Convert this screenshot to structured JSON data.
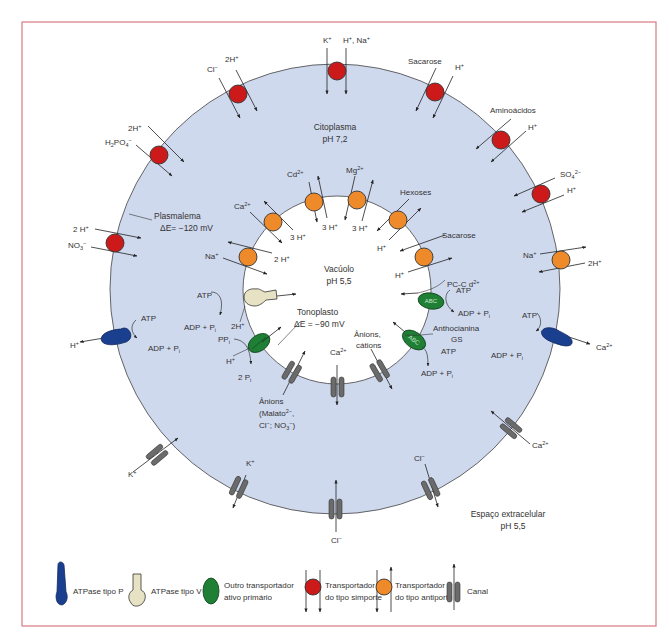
{
  "compartments": {
    "cytoplasm": {
      "label": "Citoplasma",
      "ph": "pH 7,2"
    },
    "vacuole": {
      "label": "Vacúolo",
      "ph": "pH 5,5"
    },
    "extracellular": {
      "label": "Espaço extracelular",
      "ph": "pH 5,5"
    },
    "plasmalemma": {
      "label": "Plasmalema",
      "potential": "ΔE= −120 mV"
    },
    "tonoplast": {
      "label": "Tonoplasto",
      "potential": "ΔE = −90 mV"
    }
  },
  "plasma_membrane_transporters": [
    {
      "type": "simporte",
      "substrates": [
        "K⁺",
        "H⁺, Na⁺"
      ]
    },
    {
      "type": "simporte",
      "substrates": [
        "Cl⁻",
        "2H⁺"
      ]
    },
    {
      "type": "simporte",
      "substrates": [
        "Sacarose",
        "H⁺"
      ]
    },
    {
      "type": "simporte",
      "substrates": [
        "Aminoácidos",
        "H⁺"
      ]
    },
    {
      "type": "simporte",
      "substrates": [
        "2H⁺",
        "H₂PO₄⁻"
      ]
    },
    {
      "type": "simporte",
      "substrates": [
        "SO₄²⁻",
        "H⁺"
      ]
    },
    {
      "type": "simporte",
      "substrates": [
        "2 H⁺",
        "NO₃⁻"
      ]
    },
    {
      "type": "antiporte",
      "substrates": [
        "Na⁺",
        "2H⁺"
      ]
    },
    {
      "type": "ATPase tipo P",
      "substrates": [
        "H⁺"
      ],
      "energy": [
        "ATP",
        "ADP + Pᵢ"
      ]
    },
    {
      "type": "ATPase tipo P",
      "substrates": [
        "Ca²⁺"
      ],
      "energy": [
        "ATP",
        "ADP + Pᵢ"
      ]
    },
    {
      "type": "canal",
      "substrates": [
        "K⁺"
      ]
    },
    {
      "type": "canal",
      "substrates": [
        "K⁺"
      ]
    },
    {
      "type": "canal",
      "substrates": [
        "Cl⁻"
      ]
    },
    {
      "type": "canal",
      "substrates": [
        "Cl⁻"
      ]
    },
    {
      "type": "canal",
      "substrates": [
        "Ca²⁺"
      ]
    }
  ],
  "tonoplast_transporters": [
    {
      "type": "antiporte",
      "substrates": [
        "Ca²⁺",
        "3 H⁺"
      ]
    },
    {
      "type": "antiporte",
      "substrates": [
        "Cd²⁺",
        "3 H⁺"
      ]
    },
    {
      "type": "antiporte",
      "substrates": [
        "Mg²⁺",
        "3 H⁺"
      ]
    },
    {
      "type": "antiporte",
      "substrates": [
        "Hexoses",
        "H⁺"
      ]
    },
    {
      "type": "antiporte",
      "substrates": [
        "Sacarose",
        "H⁺"
      ]
    },
    {
      "type": "antiporte",
      "substrates": [
        "Na⁺",
        "2 H⁺"
      ]
    },
    {
      "type": "ATPase tipo V",
      "substrates": [
        "2H⁺"
      ],
      "energy": [
        "ATP",
        "ADP + Pᵢ"
      ]
    },
    {
      "type": "pirofosfatase",
      "substrates": [
        "H⁺"
      ],
      "energy": [
        "PPᵢ",
        "2 Pᵢ"
      ]
    },
    {
      "type": "ABC",
      "substrates": [
        "PC-Cd²⁺"
      ],
      "energy": [
        "ATP",
        "ADP + Pᵢ"
      ]
    },
    {
      "type": "ABC",
      "substrates": [
        "Anthocianina GS"
      ],
      "energy": [
        "ATP",
        "ADP + Pᵢ"
      ]
    },
    {
      "type": "canal",
      "substrates": [
        "Ânions (Malato²⁻, Cl⁻, NO₃⁻)"
      ]
    },
    {
      "type": "canal",
      "substrates": [
        "Ca²⁺"
      ]
    },
    {
      "type": "canal",
      "substrates": [
        "Ânions, cátions"
      ]
    }
  ],
  "legend": {
    "p_atpase": "ATPase tipo P",
    "v_atpase": "ATPase tipo V",
    "other_primary_line1": "Outro transportador",
    "other_primary_line2": "ativo primário",
    "symport_line1": "Transportador",
    "symport_line2": "do tipo simporte",
    "antiport_line1": "Transportador",
    "antiport_line2": "do tipo antiporte",
    "channel": "Canal"
  },
  "labels": {
    "abc": "ABC",
    "atp": "ATP",
    "adp_pi": "ADP + P",
    "i": "i"
  },
  "colors": {
    "cytoplasm": "#cfd9ee",
    "frame": "#d77b82",
    "symport": "#cc1a1a",
    "antiport": "#ee8a2a",
    "p_atpase": "#1a3f8f",
    "v_atpase": "#e8e2c4",
    "abc": "#1f7f35",
    "channel": "#6b6b6b"
  }
}
